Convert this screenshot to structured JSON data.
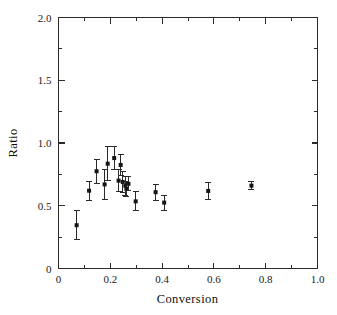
{
  "chart_data": {
    "type": "scatter",
    "title": "",
    "xlabel": "Conversion",
    "ylabel": "Ratio",
    "xlim": [
      0.0,
      1.0
    ],
    "ylim": [
      0.0,
      2.0
    ],
    "grid": false,
    "legend": null,
    "x_ticks": [
      0.0,
      0.2,
      0.4,
      0.6,
      0.8,
      1.0
    ],
    "x_tick_labels": [
      "0",
      "0.2",
      "0.4",
      "0.6",
      "0.8",
      "1.0"
    ],
    "x_minor_ticks": [
      0.1,
      0.3,
      0.5,
      0.7,
      0.9
    ],
    "y_ticks": [
      0.0,
      0.5,
      1.0,
      1.5,
      2.0
    ],
    "y_tick_labels": [
      "0",
      "0.5",
      "1.0",
      "1.5",
      "2.0"
    ],
    "y_minor_ticks": [
      0.25,
      0.75,
      1.25,
      1.75
    ],
    "marker": "square",
    "marker_color": "#151515",
    "errorbar_color": "#2a2a2a",
    "frame_color": "#2b2b2b",
    "has_error_bars": true,
    "error_bar_direction": "y",
    "points": [
      {
        "x": 0.07,
        "y": 0.345,
        "yerr": 0.115
      },
      {
        "x": 0.118,
        "y": 0.62,
        "yerr": 0.075
      },
      {
        "x": 0.147,
        "y": 0.775,
        "yerr": 0.095
      },
      {
        "x": 0.178,
        "y": 0.67,
        "yerr": 0.12
      },
      {
        "x": 0.19,
        "y": 0.835,
        "yerr": 0.135
      },
      {
        "x": 0.215,
        "y": 0.88,
        "yerr": 0.09
      },
      {
        "x": 0.232,
        "y": 0.7,
        "yerr": 0.09
      },
      {
        "x": 0.24,
        "y": 0.825,
        "yerr": 0.085
      },
      {
        "x": 0.248,
        "y": 0.69,
        "yerr": 0.085
      },
      {
        "x": 0.258,
        "y": 0.66,
        "yerr": 0.075
      },
      {
        "x": 0.262,
        "y": 0.635,
        "yerr": 0.06
      },
      {
        "x": 0.27,
        "y": 0.675,
        "yerr": 0.055
      },
      {
        "x": 0.298,
        "y": 0.535,
        "yerr": 0.075
      },
      {
        "x": 0.375,
        "y": 0.608,
        "yerr": 0.065
      },
      {
        "x": 0.408,
        "y": 0.525,
        "yerr": 0.06
      },
      {
        "x": 0.578,
        "y": 0.618,
        "yerr": 0.065
      },
      {
        "x": 0.745,
        "y": 0.66,
        "yerr": 0.03
      }
    ]
  },
  "axes": {
    "x_title": "Conversion",
    "y_title": "Ratio"
  }
}
